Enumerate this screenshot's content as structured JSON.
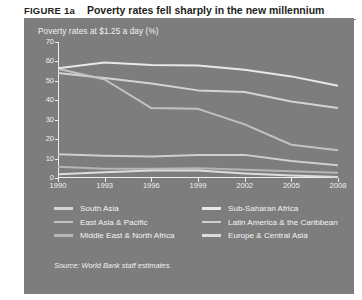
{
  "figure": {
    "label": "FIGURE 1a",
    "title": "Poverty rates fell sharply in the new millennium",
    "source_note": "Source: World Bank staff estimates."
  },
  "panel": {
    "background_color": "#7d7d7d",
    "axis_color": "#efefef",
    "text_color": "#f2f2f2"
  },
  "chart_data": {
    "type": "line",
    "title": "Poverty rates at $1.25 a day (%)",
    "xlabel": "",
    "ylabel": "",
    "x": [
      1990,
      1993,
      1996,
      1999,
      2002,
      2005,
      2008
    ],
    "tick_labels_x": [
      "1990",
      "1993",
      "1996",
      "1999",
      "2002",
      "2005",
      "2008"
    ],
    "tick_labels_y": [
      "0",
      "10",
      "20",
      "30",
      "40",
      "50",
      "60",
      "70"
    ],
    "ylim": [
      0,
      70
    ],
    "ytick_step": 10,
    "grid": false,
    "legend_position": "bottom",
    "series": [
      {
        "name": "South Asia",
        "color": "#d4d4d4",
        "values": [
          54.0,
          51.5,
          48.6,
          45.1,
          44.3,
          39.4,
          36.0
        ]
      },
      {
        "name": "East Asia & Pacific",
        "color": "#c2c2c2",
        "values": [
          56.2,
          50.7,
          36.0,
          35.6,
          27.6,
          17.1,
          14.3
        ]
      },
      {
        "name": "Middle East & North Africa",
        "color": "#b5b5b5",
        "values": [
          5.8,
          4.8,
          4.8,
          5.0,
          4.2,
          3.5,
          2.7
        ]
      },
      {
        "name": "Sub-Saharan Africa",
        "color": "#e8e8e8",
        "values": [
          56.5,
          59.4,
          58.1,
          57.9,
          55.7,
          52.3,
          47.5
        ]
      },
      {
        "name": "Latin America & the Caribbean",
        "color": "#cfcfcf",
        "values": [
          12.2,
          11.4,
          11.1,
          11.9,
          11.9,
          8.7,
          6.5
        ]
      },
      {
        "name": "Europe & Central Asia",
        "color": "#dcdcdc",
        "values": [
          1.9,
          2.9,
          3.9,
          3.8,
          2.3,
          1.3,
          0.5
        ]
      }
    ]
  },
  "legend": {
    "items": [
      {
        "label": "South Asia",
        "color": "#d4d4d4"
      },
      {
        "label": "Sub-Saharan Africa",
        "color": "#e8e8e8"
      },
      {
        "label": "East Asia & Pacific",
        "color": "#c2c2c2"
      },
      {
        "label": "Latin America & the Caribbean",
        "color": "#cfcfcf"
      },
      {
        "label": "Middle East & North Africa",
        "color": "#b5b5b5"
      },
      {
        "label": "Europe & Central Asia",
        "color": "#dcdcdc"
      }
    ]
  }
}
